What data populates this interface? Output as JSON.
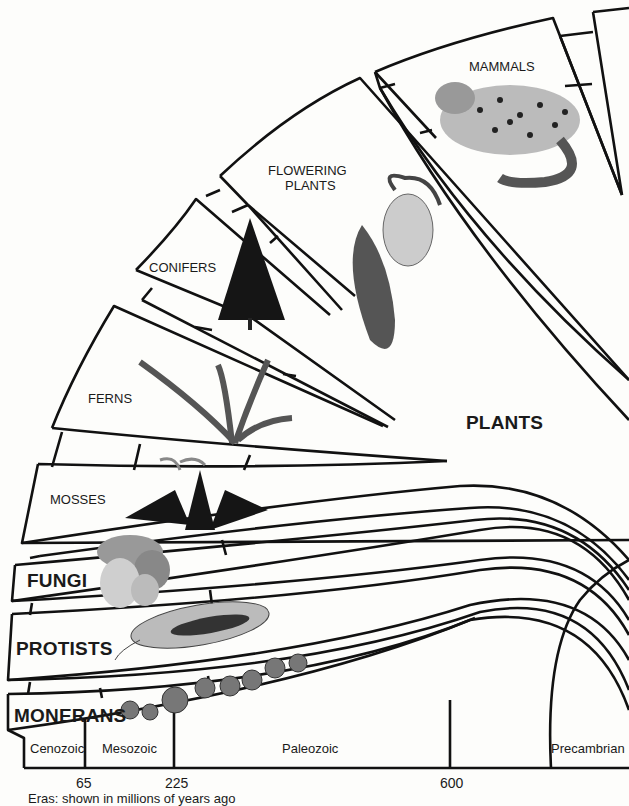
{
  "groups": {
    "mammals": "MAMMALS",
    "flowering_plants_line1": "FLOWERING",
    "flowering_plants_line2": "PLANTS",
    "conifers": "CONIFERS",
    "ferns": "FERNS",
    "mosses": "MOSSES",
    "plants": "PLANTS",
    "fungi": "FUNGI",
    "protists": "PROTISTS",
    "monerans": "MONERANS"
  },
  "eras": [
    {
      "name": "Cenozoic"
    },
    {
      "name": "Mesozoic"
    },
    {
      "name": "Paleozoic"
    },
    {
      "name": "Precambrian"
    }
  ],
  "ticks": [
    "65",
    "225",
    "600"
  ],
  "caption": "Eras: shown in millions of years ago",
  "illustrations": [
    "snow-leopard",
    "ladys-slipper-orchid",
    "spruce-tree",
    "fern",
    "moss",
    "mushrooms",
    "euglena-protist",
    "bacteria-spheres"
  ],
  "colors": {
    "line": "#111111",
    "background": "#fdfdfb"
  }
}
